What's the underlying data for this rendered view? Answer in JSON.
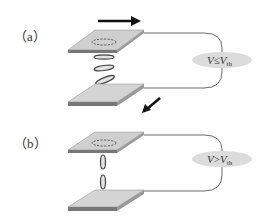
{
  "panels": [
    {
      "id": "a",
      "label": "（a）",
      "condition": {
        "v": "V",
        "op": "≤",
        "vth": "V",
        "sub": "th"
      },
      "state": "multiple tilted ring vortices between plates",
      "arrow_top": "right",
      "arrow_bottom": "down-left"
    },
    {
      "id": "b",
      "label": "（b）",
      "condition": {
        "v": "V",
        "op": ">",
        "vth": "V",
        "sub": "th"
      },
      "state": "vertical elongated loops bridging plates"
    }
  ],
  "colors": {
    "plate_top": "#cfcfcf",
    "plate_side": "#9a9a9a",
    "plate_edge": "#555555",
    "ellipse_fill": "#e2e2e2",
    "wire": "#444444",
    "arrow": "#111111"
  }
}
